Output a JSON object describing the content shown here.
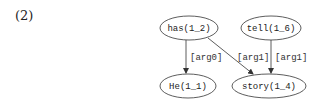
{
  "example_number": "(2)",
  "nodes": [
    {
      "id": "has",
      "label": "has(1_2)",
      "cx": 189,
      "cy": 28,
      "rx": 29,
      "ry": 12
    },
    {
      "id": "tell",
      "label": "tell(1_6)",
      "cx": 271,
      "cy": 28,
      "rx": 30,
      "ry": 12
    },
    {
      "id": "he",
      "label": "He(1_1)",
      "cx": 188,
      "cy": 86,
      "rx": 28,
      "ry": 12
    },
    {
      "id": "story",
      "label": "story(1_4)",
      "cx": 269,
      "cy": 86,
      "rx": 37,
      "ry": 12
    }
  ],
  "edges": [
    {
      "from": "has",
      "to": "he",
      "label": "[arg0]"
    },
    {
      "from": "has",
      "to": "story",
      "label": "[arg1]"
    },
    {
      "from": "tell",
      "to": "story",
      "label": "[arg1]"
    }
  ],
  "colors": {
    "stroke": "#333333",
    "text": "#222222",
    "background": "#ffffff"
  }
}
